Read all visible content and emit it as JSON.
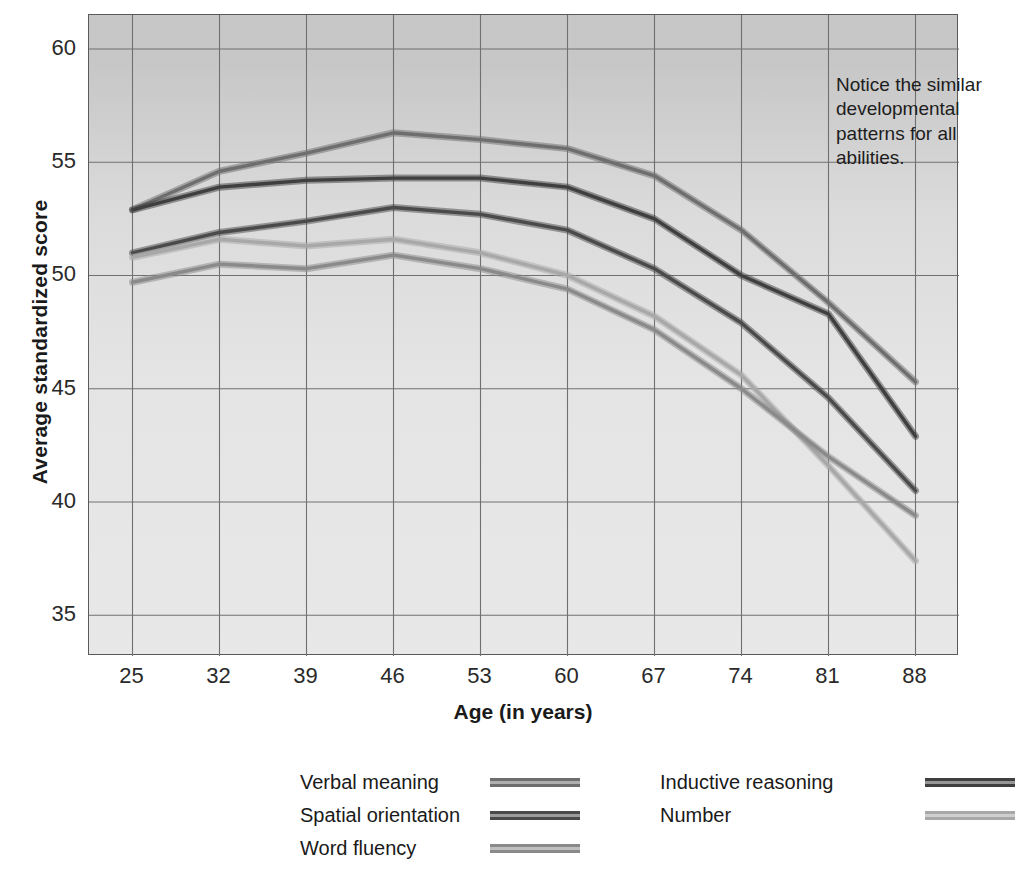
{
  "chart_data": {
    "type": "line",
    "title": "",
    "xlabel": "Age (in years)",
    "ylabel": "Average standardized score",
    "x": [
      25,
      32,
      39,
      46,
      53,
      60,
      67,
      74,
      81,
      88
    ],
    "xticks": [
      "25",
      "32",
      "39",
      "46",
      "53",
      "60",
      "67",
      "74",
      "81",
      "88"
    ],
    "yticks": [
      "35",
      "40",
      "45",
      "50",
      "55",
      "60"
    ],
    "xlim": [
      21.5,
      91.5
    ],
    "ylim": [
      33.2,
      61.5
    ],
    "grid": true,
    "legend_position": "below",
    "annotation": "Notice the similar developmental patterns for all abilities.",
    "series": [
      {
        "name": "Verbal meaning",
        "color": "#6e6e6e",
        "values": [
          52.9,
          54.6,
          55.4,
          56.3,
          56.0,
          55.6,
          54.4,
          52.0,
          48.8,
          45.3
        ]
      },
      {
        "name": "Inductive reasoning",
        "color": "#3f3f3f",
        "values": [
          52.9,
          53.9,
          54.2,
          54.3,
          54.3,
          53.9,
          52.5,
          50.0,
          48.3,
          42.9
        ]
      },
      {
        "name": "Spatial orientation",
        "color": "#4a4a4a",
        "values": [
          51.0,
          51.9,
          52.4,
          53.0,
          52.7,
          52.0,
          50.3,
          47.9,
          44.6,
          40.5
        ]
      },
      {
        "name": "Number",
        "color": "#a8a8a8",
        "values": [
          50.8,
          51.6,
          51.3,
          51.6,
          51.0,
          50.0,
          48.2,
          45.6,
          41.6,
          37.4
        ]
      },
      {
        "name": "Word fluency",
        "color": "#8a8a8a",
        "values": [
          49.7,
          50.5,
          50.3,
          50.9,
          50.3,
          49.4,
          47.6,
          45.0,
          42.0,
          39.4
        ]
      }
    ]
  },
  "legend": {
    "columns": [
      {
        "items": [
          {
            "label": "Verbal meaning",
            "color": "#6e6e6e"
          },
          {
            "label": "Spatial orientation",
            "color": "#4a4a4a"
          },
          {
            "label": "Word fluency",
            "color": "#8a8a8a"
          }
        ]
      },
      {
        "items": [
          {
            "label": "Inductive reasoning",
            "color": "#3f3f3f"
          },
          {
            "label": "Number",
            "color": "#a8a8a8"
          }
        ]
      }
    ]
  }
}
